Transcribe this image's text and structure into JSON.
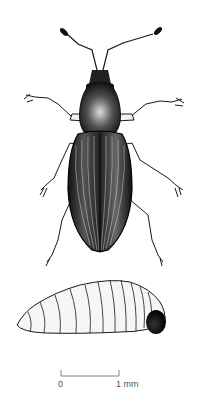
{
  "figure": {
    "colors": {
      "ink": "#1a1a1a",
      "paper": "#ffffff",
      "scale": "#666666"
    }
  },
  "scale_bar": {
    "start_label": "0",
    "end_label": "1 mm"
  }
}
